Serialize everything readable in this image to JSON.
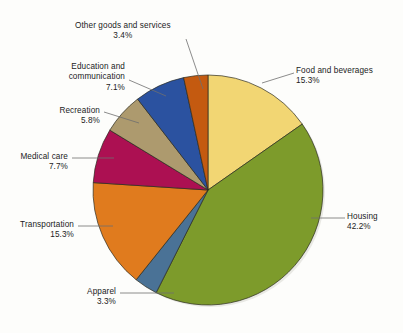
{
  "chart_data": {
    "type": "pie",
    "title": "",
    "xlabel": "",
    "ylabel": "",
    "legend_position": "callout-labels",
    "grid": false,
    "total": 100.1,
    "start_angle_deg": 0,
    "direction": "clockwise",
    "categories": [
      "Food and beverages",
      "Housing",
      "Apparel",
      "Transportation",
      "Medical care",
      "Recreation",
      "Education and communication",
      "Other goods and services"
    ],
    "values": [
      15.3,
      42.2,
      3.3,
      15.3,
      7.7,
      5.8,
      7.1,
      3.4
    ],
    "value_labels": [
      "15.3%",
      "42.2%",
      "3.3%",
      "15.3%",
      "7.7%",
      "5.8%",
      "7.1%",
      "3.4%"
    ],
    "colors": [
      "#f2d673",
      "#7d9b2b",
      "#4a7296",
      "#e07b1e",
      "#ac1052",
      "#ad9a6e",
      "#2b52a0",
      "#c45a10"
    ]
  },
  "slices": [
    {
      "name": "food-and-beverages",
      "label_line1": "Food and beverages",
      "label_line2": "",
      "percent": "15.3%",
      "color": "#f2d673"
    },
    {
      "name": "housing",
      "label_line1": "Housing",
      "label_line2": "",
      "percent": "42.2%",
      "color": "#7d9b2b"
    },
    {
      "name": "apparel",
      "label_line1": "Apparel",
      "label_line2": "",
      "percent": "3.3%",
      "color": "#4a7296"
    },
    {
      "name": "transportation",
      "label_line1": "Transportation",
      "label_line2": "",
      "percent": "15.3%",
      "color": "#e07b1e"
    },
    {
      "name": "medical-care",
      "label_line1": "Medical care",
      "label_line2": "",
      "percent": "7.7%",
      "color": "#ac1052"
    },
    {
      "name": "recreation",
      "label_line1": "Recreation",
      "label_line2": "",
      "percent": "5.8%",
      "color": "#ad9a6e"
    },
    {
      "name": "education-and-communication",
      "label_line1": "Education and",
      "label_line2": "communication",
      "percent": "7.1%",
      "color": "#2b52a0"
    },
    {
      "name": "other-goods-and-services",
      "label_line1": "Other goods and services",
      "label_line2": "",
      "percent": "3.4%",
      "color": "#c45a10"
    }
  ]
}
